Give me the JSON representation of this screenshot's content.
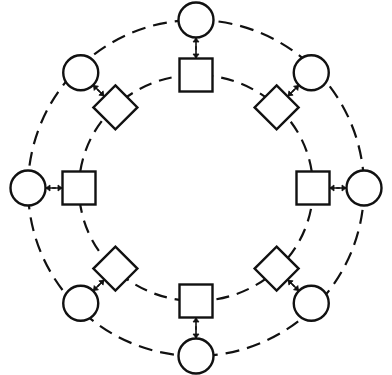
{
  "diagram": {
    "type": "concentric-ring-network",
    "colors": {
      "stroke": "#111111",
      "background": "#ffffff",
      "node_fill": "#ffffff"
    },
    "rings": [
      {
        "id": "outer-ring",
        "style": "dashed",
        "node_shape": "circle"
      },
      {
        "id": "inner-ring",
        "style": "dashed",
        "node_shape": "square"
      }
    ],
    "spokes": [
      {
        "id": "top",
        "angle_deg": -90,
        "outer": "circle",
        "inner": "square"
      },
      {
        "id": "top-right",
        "angle_deg": -45,
        "outer": "circle",
        "inner": "diamond"
      },
      {
        "id": "right",
        "angle_deg": 0,
        "outer": "circle",
        "inner": "square"
      },
      {
        "id": "bottom-right",
        "angle_deg": 45,
        "outer": "circle",
        "inner": "diamond"
      },
      {
        "id": "bottom",
        "angle_deg": 90,
        "outer": "circle",
        "inner": "square"
      },
      {
        "id": "bottom-left",
        "angle_deg": 135,
        "outer": "circle",
        "inner": "diamond"
      },
      {
        "id": "left",
        "angle_deg": 180,
        "outer": "circle",
        "inner": "square"
      },
      {
        "id": "top-left",
        "angle_deg": -135,
        "outer": "circle",
        "inner": "diamond"
      }
    ],
    "connector": {
      "type": "bidirectional-arrow-pair",
      "between": [
        "outer-node",
        "inner-node"
      ]
    }
  }
}
